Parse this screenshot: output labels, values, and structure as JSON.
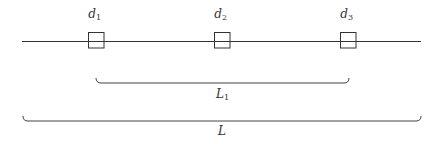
{
  "diagram": {
    "line": {
      "x1": 22,
      "x2": 421,
      "y": 41,
      "color": "#333333"
    },
    "detectors": [
      {
        "label": "d",
        "sub": "1",
        "x": 88,
        "y": 32,
        "size": 15.5
      },
      {
        "label": "d",
        "sub": "2",
        "x": 214,
        "y": 32,
        "size": 15.5
      },
      {
        "label": "d",
        "sub": "3",
        "x": 340,
        "y": 32,
        "size": 15.5
      }
    ],
    "braces": [
      {
        "label": "L",
        "sub": "1",
        "x1": 96,
        "x2": 349,
        "y": 78,
        "label_y": 98
      },
      {
        "label": "L",
        "sub": "",
        "x1": 23,
        "x2": 421,
        "y": 116,
        "label_y": 135
      }
    ]
  }
}
